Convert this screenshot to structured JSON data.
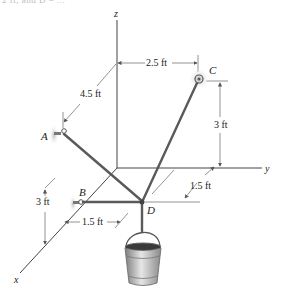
{
  "header": {
    "cut_off_text": "2 ft, and D = ..."
  },
  "axes": {
    "x_label": "x",
    "y_label": "y",
    "z_label": "z"
  },
  "points": {
    "A": "A",
    "B": "B",
    "C": "C",
    "D": "D"
  },
  "dimensions": {
    "z_to_C_horizontal": "2.5 ft",
    "origin_to_A": "4.5 ft",
    "C_height": "3 ft",
    "A_height": "3 ft",
    "B_offset_x": "1.5 ft",
    "D_offset_y": "1.5 ft"
  },
  "colors": {
    "cable": "#555555",
    "axis": "#444444",
    "dim_line": "#666666",
    "bucket": "#9a9a9a",
    "bucket_fill": "#3a3a3a",
    "support_glow": "#cfcfcf"
  }
}
